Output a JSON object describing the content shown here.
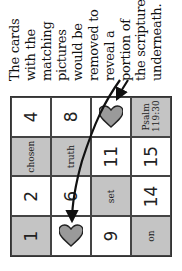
{
  "caption": {
    "lines": [
      "The cards",
      "with the",
      "matching",
      "pictures",
      "would be",
      "removed to",
      "reveal a",
      "portion of",
      "the scripture",
      "underneath."
    ]
  },
  "grid": {
    "rows": [
      [
        {
          "text": "1",
          "style": "gray-num"
        },
        {
          "text": "2",
          "style": "num"
        },
        {
          "text": "chosen",
          "style": "gray-word"
        },
        {
          "text": "4",
          "style": "num"
        }
      ],
      [
        {
          "icon": "heart-icon",
          "style": "heart"
        },
        {
          "text": "6",
          "style": "num"
        },
        {
          "text": "truth",
          "style": "gray-word"
        },
        {
          "text": "8",
          "style": "num"
        }
      ],
      [
        {
          "text": "9",
          "style": "num"
        },
        {
          "text": "set",
          "style": "gray-word"
        },
        {
          "text": "11",
          "style": "num"
        },
        {
          "icon": "heart-icon",
          "style": "heart"
        }
      ],
      [
        {
          "text": "on",
          "style": "gray-word"
        },
        {
          "text": "14",
          "style": "num"
        },
        {
          "text": "15",
          "style": "num"
        },
        {
          "text": "Psalm 119:30",
          "style": "gray-ref"
        }
      ]
    ]
  },
  "colors": {
    "card_gray": "#c4c4c4",
    "heart_fill": "#9a9a9a",
    "line": "#333333",
    "arrow": "#111111"
  },
  "orientation": "rotated -90deg"
}
